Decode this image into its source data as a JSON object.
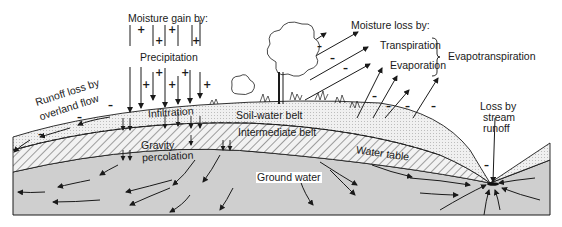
{
  "diagram": {
    "colors": {
      "ink": "#1a1a1a",
      "ground_water_fill": "#cfcfcf",
      "soil_belt_fill": "#ebebeb",
      "intermediate_hatch": "#555555",
      "background": "#ffffff"
    },
    "labels": {
      "moisture_gain": "Moisture gain by:",
      "precipitation": "Precipitation",
      "infiltration": "Infiltration",
      "runoff_line1": "Runoff loss by",
      "runoff_line2": "overland flow",
      "gravity_line1": "Gravity",
      "gravity_line2": "percolation",
      "soil_water_belt": "Soil-water belt",
      "intermediate_belt": "Intermediate belt",
      "water_table": "Water table",
      "ground_water": "Ground water",
      "moisture_loss": "Moisture loss by:",
      "transpiration": "Transpiration",
      "evaporation": "Evaporation",
      "evapotranspiration": "Evapotranspiration",
      "stream_line1": "Loss by",
      "stream_line2": "stream",
      "stream_line3": "runoff"
    },
    "signs": {
      "gain": "+",
      "loss": "–"
    }
  }
}
